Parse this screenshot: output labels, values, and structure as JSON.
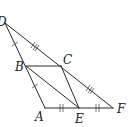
{
  "diagram": {
    "type": "geometry",
    "points": {
      "D": {
        "label": "D"
      },
      "C": {
        "label": "C"
      },
      "B": {
        "label": "B"
      },
      "A": {
        "label": "A"
      },
      "E": {
        "label": "E"
      },
      "F": {
        "label": "F"
      }
    },
    "segments": [
      {
        "from": "D",
        "to": "A",
        "ticks": 1,
        "note": "DB = BA (single tick)"
      },
      {
        "from": "D",
        "to": "F",
        "ticks": 3,
        "note": "DC = CF (triple tick)"
      },
      {
        "from": "A",
        "to": "F",
        "ticks": 2,
        "note": "AE = EF (double tick)"
      },
      {
        "from": "B",
        "to": "C",
        "ticks": 0
      },
      {
        "from": "B",
        "to": "E",
        "ticks": 0
      },
      {
        "from": "C",
        "to": "E",
        "ticks": 0
      }
    ],
    "stroke_color": "#2a2a2a"
  }
}
